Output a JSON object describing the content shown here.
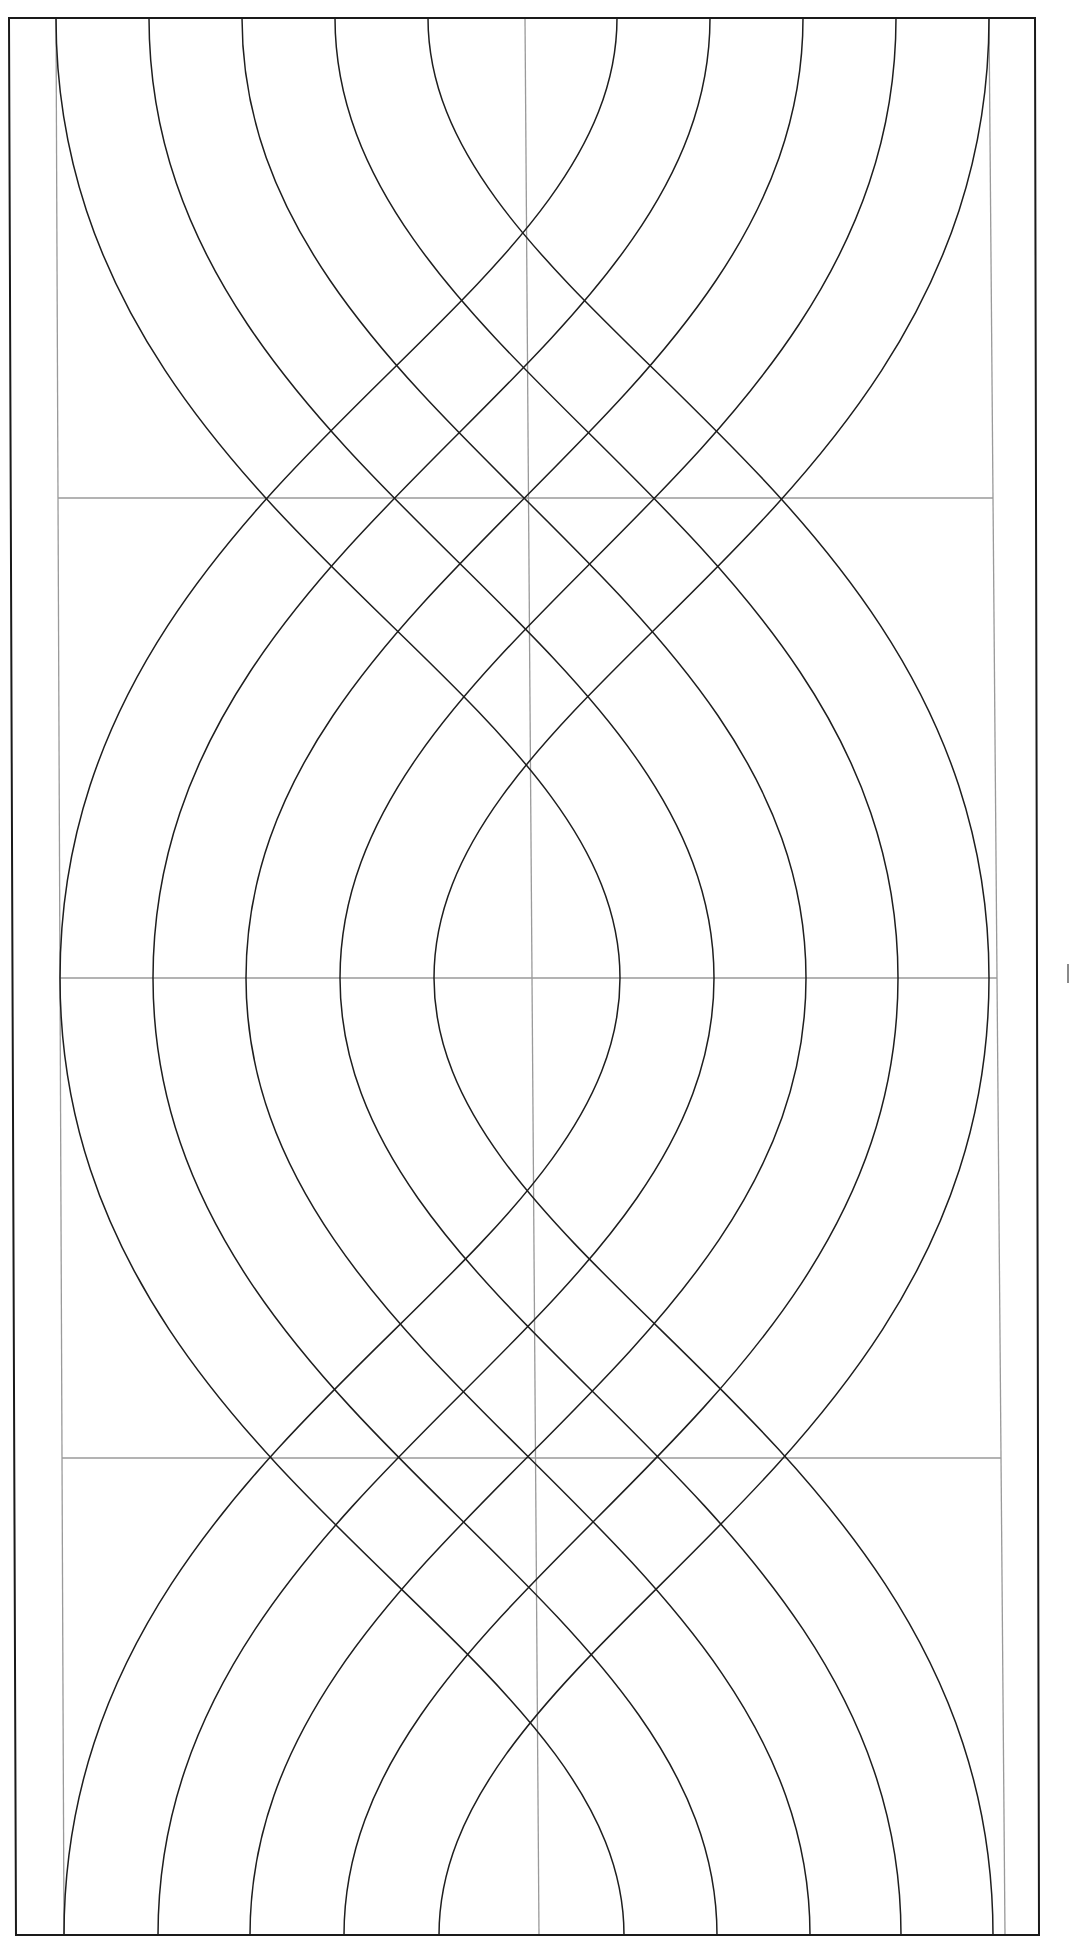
{
  "diagram": {
    "title": "",
    "canvas": {
      "width": 1070,
      "height": 1946,
      "background": "#ffffff"
    },
    "colors": {
      "curve": "#1e1e1e",
      "guide": "#9a9a9a",
      "border": "#1a1a1a",
      "tick": "#8a8a8a"
    },
    "border": [
      [
        9,
        18
      ],
      [
        1035,
        18
      ],
      [
        1039,
        1935
      ],
      [
        16,
        1935
      ]
    ],
    "guides": {
      "vertical": [
        {
          "name": "left-guide",
          "x1": 56,
          "y1": 18,
          "x2": 64,
          "y2": 1935
        },
        {
          "name": "center-guide",
          "x1": 525,
          "y1": 18,
          "x2": 539,
          "y2": 1935
        },
        {
          "name": "right-guide",
          "x1": 989,
          "y1": 18,
          "x2": 1005,
          "y2": 1935
        }
      ],
      "horizontal": [
        {
          "name": "guide-row-1",
          "y": 498
        },
        {
          "name": "guide-row-2",
          "y": 978
        },
        {
          "name": "guide-row-3",
          "y": 1458
        }
      ]
    },
    "bands": [
      {
        "name": "upper-band",
        "y_top": 18,
        "y_bottom": 978,
        "top_x_left": [
          428,
          335,
          242,
          149,
          56
        ],
        "top_x_right": [
          617,
          710,
          803,
          896,
          989
        ],
        "bottom_x_left": [
          434,
          340,
          246,
          153,
          60
        ],
        "bottom_x_right": [
          620,
          714,
          806,
          898,
          989
        ]
      },
      {
        "name": "lower-band",
        "y_top": 978,
        "y_bottom": 1935,
        "top_x_left": [
          434,
          340,
          246,
          153,
          60
        ],
        "top_x_right": [
          620,
          714,
          806,
          898,
          989
        ],
        "bottom_x_left": [
          439,
          344,
          250,
          158,
          64
        ],
        "bottom_x_right": [
          624,
          717,
          810,
          901,
          993
        ]
      }
    ],
    "curve_control": {
      "inner_near": 300,
      "inner_far": 500,
      "step": 50
    },
    "margin_tick": {
      "x": 1068,
      "y1": 964,
      "y2": 983
    }
  }
}
